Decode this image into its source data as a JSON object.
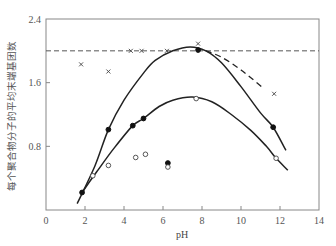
{
  "chart_data": {
    "type": "scatter",
    "title": "",
    "xlabel": "pH",
    "ylabel": "每个聚合物分子的平均末端基团数",
    "xlim": [
      0,
      14
    ],
    "ylim": [
      0,
      2.4
    ],
    "xticks": [
      0,
      2,
      4,
      6,
      8,
      10,
      12,
      14
    ],
    "yticks": [
      0.8,
      1.6,
      2.4
    ],
    "ytick_labels": [
      "0.8",
      "1.6",
      "2.4"
    ],
    "grid": false,
    "legend": null,
    "reference_line": {
      "style": "dashed",
      "y": 2.0
    },
    "series": [
      {
        "name": "filled-circles",
        "marker": "filled-circle",
        "points": [
          [
            1.85,
            0.22
          ],
          [
            3.2,
            1.01
          ],
          [
            4.45,
            1.06
          ],
          [
            5.0,
            1.15
          ],
          [
            6.25,
            0.59
          ],
          [
            7.8,
            2.01
          ],
          [
            11.65,
            1.04
          ]
        ]
      },
      {
        "name": "open-circles",
        "marker": "open-circle",
        "points": [
          [
            2.4,
            0.43
          ],
          [
            3.2,
            0.56
          ],
          [
            4.6,
            0.66
          ],
          [
            5.1,
            0.7
          ],
          [
            6.25,
            0.54
          ],
          [
            7.7,
            1.4
          ],
          [
            11.8,
            0.65
          ]
        ]
      },
      {
        "name": "crosses",
        "marker": "x",
        "points": [
          [
            1.8,
            1.83
          ],
          [
            3.2,
            1.74
          ],
          [
            4.35,
            2.0
          ],
          [
            4.9,
            2.0
          ],
          [
            6.2,
            2.0
          ],
          [
            7.8,
            2.09
          ],
          [
            11.7,
            1.46
          ]
        ]
      }
    ],
    "curves": [
      {
        "name": "upper-fit-curve",
        "style": "solid",
        "points": [
          [
            1.6,
            0.08
          ],
          [
            2.5,
            0.55
          ],
          [
            3.2,
            1.01
          ],
          [
            4.0,
            1.38
          ],
          [
            5.0,
            1.72
          ],
          [
            5.6,
            1.88
          ],
          [
            6.5,
            2.0
          ],
          [
            7.4,
            2.05
          ],
          [
            8.2,
            2.0
          ],
          [
            9.0,
            1.85
          ],
          [
            10.0,
            1.55
          ],
          [
            11.0,
            1.22
          ],
          [
            11.65,
            1.04
          ],
          [
            12.3,
            0.75
          ]
        ]
      },
      {
        "name": "lower-fit-curve",
        "style": "solid",
        "points": [
          [
            1.85,
            0.22
          ],
          [
            2.6,
            0.48
          ],
          [
            3.5,
            0.78
          ],
          [
            4.45,
            1.06
          ],
          [
            5.0,
            1.15
          ],
          [
            5.8,
            1.3
          ],
          [
            6.5,
            1.38
          ],
          [
            7.5,
            1.42
          ],
          [
            8.5,
            1.36
          ],
          [
            9.5,
            1.2
          ],
          [
            10.5,
            1.0
          ],
          [
            11.3,
            0.8
          ],
          [
            11.8,
            0.65
          ],
          [
            12.4,
            0.5
          ]
        ]
      },
      {
        "name": "dashed-fit-curve",
        "style": "dashed",
        "points": [
          [
            8.2,
            2.0
          ],
          [
            9.0,
            1.92
          ],
          [
            10.0,
            1.76
          ],
          [
            11.1,
            1.54
          ]
        ]
      }
    ]
  }
}
